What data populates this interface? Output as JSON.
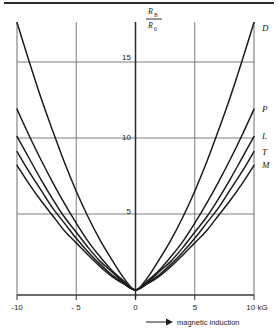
{
  "figure": {
    "has_top_rule": true,
    "background_color": "#ffffff",
    "line_color": "#1c1c1c",
    "grid_color": "#6e6e6e"
  },
  "axis_label_y": {
    "numerator_main": "R",
    "numerator_sub": "B",
    "denominator_main": "R",
    "denominator_sub": "0"
  },
  "axis_label_x": {
    "arrow": "⟶",
    "text": "magnetic induction",
    "unit": "kG"
  },
  "chart_data": {
    "type": "line",
    "title": "",
    "subtitle": "",
    "xlabel": "magnetic induction",
    "ylabel": "R_B / R_0",
    "xunit": "kG",
    "xlim": [
      -10,
      10
    ],
    "ylim": [
      0,
      17.6
    ],
    "grid": true,
    "grid_x": [
      -10,
      -5,
      0,
      5,
      10
    ],
    "grid_y": [
      5,
      10,
      15
    ],
    "xticks": [
      -10,
      -5,
      0,
      5,
      10
    ],
    "xticklabels": [
      "-10",
      "- 5",
      "0",
      "5",
      "10 kG"
    ],
    "yticks": [
      5,
      10,
      15
    ],
    "yticklabels": [
      "5",
      "10",
      "15"
    ],
    "legend_position": "right-of-curve-ends",
    "annotations": [
      "D",
      "P",
      "L",
      "T",
      "M"
    ],
    "x": [
      -10,
      -9,
      -8,
      -7,
      -6,
      -5,
      -4,
      -3,
      -2,
      -1,
      0,
      1,
      2,
      3,
      4,
      5,
      6,
      7,
      8,
      9,
      10
    ],
    "series": [
      {
        "name": "D",
        "label": "D",
        "values": [
          17.6,
          15.1,
          12.7,
          10.5,
          8.4,
          6.5,
          4.8,
          3.3,
          2.0,
          0.8,
          0.0,
          0.8,
          2.0,
          3.3,
          4.8,
          6.5,
          8.4,
          10.5,
          12.7,
          15.1,
          17.6
        ]
      },
      {
        "name": "P",
        "label": "P",
        "values": [
          11.9,
          10.2,
          8.6,
          7.1,
          5.7,
          4.4,
          3.2,
          2.2,
          1.3,
          0.6,
          0.0,
          0.6,
          1.3,
          2.2,
          3.2,
          4.4,
          5.7,
          7.1,
          8.6,
          10.2,
          11.9
        ]
      },
      {
        "name": "L",
        "label": "L",
        "values": [
          10.1,
          8.7,
          7.3,
          6.0,
          4.8,
          3.8,
          2.8,
          1.9,
          1.2,
          0.5,
          0.0,
          0.5,
          1.2,
          1.9,
          2.8,
          3.8,
          4.8,
          6.0,
          7.3,
          8.7,
          10.1
        ]
      },
      {
        "name": "T",
        "label": "T",
        "values": [
          9.1,
          7.8,
          6.6,
          5.4,
          4.4,
          3.4,
          2.5,
          1.7,
          1.0,
          0.45,
          0.0,
          0.45,
          1.0,
          1.7,
          2.5,
          3.4,
          4.4,
          5.4,
          6.6,
          7.8,
          9.1
        ]
      },
      {
        "name": "M",
        "label": "M",
        "values": [
          8.2,
          7.0,
          5.9,
          4.9,
          3.9,
          3.1,
          2.3,
          1.55,
          0.9,
          0.4,
          0.0,
          0.4,
          0.9,
          1.55,
          2.3,
          3.1,
          3.9,
          4.9,
          5.9,
          7.0,
          8.2
        ]
      }
    ]
  }
}
